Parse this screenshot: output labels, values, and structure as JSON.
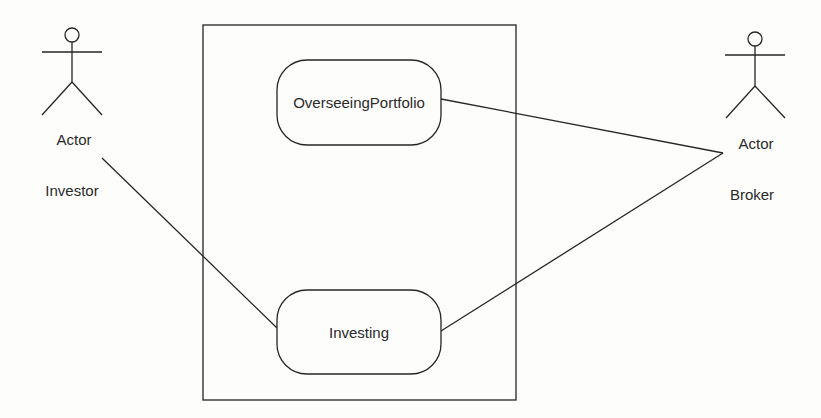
{
  "diagram": {
    "type": "uml-use-case",
    "system_boundary": {
      "label": ""
    },
    "actors": [
      {
        "id": "investor",
        "stereotype_label": "Actor",
        "name": "Investor"
      },
      {
        "id": "broker",
        "stereotype_label": "Actor",
        "name": "Broker"
      }
    ],
    "use_cases": [
      {
        "id": "overseeing",
        "label": "OverseeingPortfolio"
      },
      {
        "id": "investing",
        "label": "Investing"
      }
    ],
    "associations": [
      {
        "from": "investor",
        "to": "investing"
      },
      {
        "from": "broker",
        "to": "overseeing"
      },
      {
        "from": "broker",
        "to": "investing"
      }
    ],
    "colors": {
      "line": "#262626",
      "background": "#fdfdfb",
      "text": "#2a2a2a"
    }
  }
}
